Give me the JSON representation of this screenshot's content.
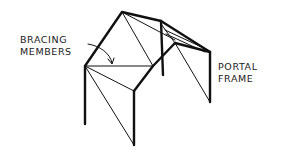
{
  "diagram": {
    "type": "structural-sketch",
    "labels": {
      "bracing": {
        "line1": "BRACING",
        "line2": "MEMBERS"
      },
      "portal": {
        "line1": "PORTAL",
        "line2": "FRAME"
      }
    },
    "colors": {
      "ink": "#111111",
      "background": "#ffffff"
    }
  }
}
